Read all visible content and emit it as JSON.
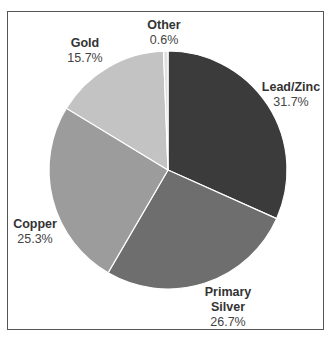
{
  "chart_data": {
    "type": "pie",
    "title": "",
    "categories": [
      "Lead/Zinc",
      "Primary Silver",
      "Copper",
      "Gold",
      "Other"
    ],
    "values": [
      31.7,
      26.7,
      25.3,
      15.7,
      0.6
    ],
    "value_labels": [
      "31.7%",
      "26.7%",
      "25.3%",
      "15.7%",
      "0.6%"
    ],
    "colors": [
      "#3b3b3b",
      "#6e6e6e",
      "#9c9c9c",
      "#c3c3c3",
      "#e0e0e0"
    ],
    "start_angle_deg": 0,
    "direction": "clockwise",
    "legend": "none (direct labels)"
  },
  "labels": {
    "lead_zinc": {
      "name": "Lead/Zinc",
      "value": "31.7%"
    },
    "primary_silver": {
      "name_line1": "Primary",
      "name_line2": "Silver",
      "value": "26.7%"
    },
    "copper": {
      "name": "Copper",
      "value": "25.3%"
    },
    "gold": {
      "name": "Gold",
      "value": "15.7%"
    },
    "other": {
      "name": "Other",
      "value": "0.6%"
    }
  }
}
